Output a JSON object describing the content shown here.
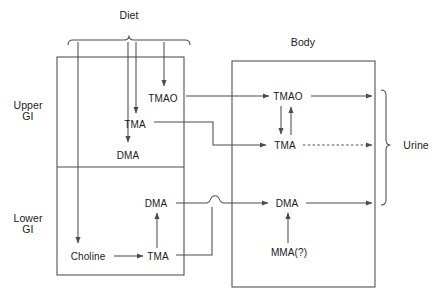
{
  "diagram": {
    "type": "flow-diagram",
    "canvas": {
      "width": 441,
      "height": 300,
      "background": "#ffffff"
    },
    "stroke_color": "#4d4d4d",
    "text_color": "#1a1a1a",
    "groups": [
      {
        "id": "diet",
        "name": "diet-brace-group",
        "label": "Diet",
        "label_x": 129,
        "label_y": 15,
        "brace": {
          "x1": 68,
          "x2": 190,
          "y": 40,
          "tip_x": 129,
          "orientation": "down"
        },
        "feeds": [
          "Choline",
          "DMA",
          "TMA",
          "TMAO"
        ]
      },
      {
        "id": "gi",
        "name": "gi-tract-box",
        "label": "",
        "box": {
          "x": 57,
          "y": 57,
          "w": 127,
          "h": 218
        },
        "divider_y": 167,
        "compartments": [
          {
            "id": "upper-gi",
            "label": "Upper\nGI",
            "label_x": 28,
            "label_y": 111
          },
          {
            "id": "lower-gi",
            "label": "Lower\nGI",
            "label_x": 28,
            "label_y": 224
          }
        ]
      },
      {
        "id": "body",
        "name": "body-box",
        "label": "Body",
        "label_x": 303,
        "label_y": 42,
        "box": {
          "x": 232,
          "y": 61,
          "w": 143,
          "h": 226
        }
      },
      {
        "id": "urine",
        "name": "urine-brace-group",
        "label": "Urine",
        "label_x": 416,
        "label_y": 145,
        "brace": {
          "y1": 90,
          "y2": 205,
          "x": 386,
          "tip_y": 145,
          "orientation": "right"
        }
      }
    ],
    "nodes": [
      {
        "id": "gi-tmao",
        "name": "node-gi-tmao",
        "label": "TMAO",
        "x": 163,
        "y": 98,
        "compartment": "upper-gi"
      },
      {
        "id": "gi-tma-u",
        "name": "node-gi-tma-upper",
        "label": "TMA",
        "x": 135,
        "y": 124,
        "compartment": "upper-gi"
      },
      {
        "id": "gi-dma-u",
        "name": "node-gi-dma-upper",
        "label": "DMA",
        "x": 128,
        "y": 155,
        "compartment": "upper-gi"
      },
      {
        "id": "gi-dma-l",
        "name": "node-gi-dma-lower",
        "label": "DMA",
        "x": 156,
        "y": 203,
        "compartment": "lower-gi"
      },
      {
        "id": "gi-choline",
        "name": "node-choline",
        "label": "Choline",
        "x": 88,
        "y": 256,
        "compartment": "lower-gi"
      },
      {
        "id": "gi-tma-l",
        "name": "node-gi-tma-lower",
        "label": "TMA",
        "x": 158,
        "y": 256,
        "compartment": "lower-gi"
      },
      {
        "id": "body-tmao",
        "name": "node-body-tmao",
        "label": "TMAO",
        "x": 288,
        "y": 96,
        "compartment": "body"
      },
      {
        "id": "body-tma",
        "name": "node-body-tma",
        "label": "TMA",
        "x": 285,
        "y": 145,
        "compartment": "body"
      },
      {
        "id": "body-dma",
        "name": "node-body-dma",
        "label": "DMA",
        "x": 287,
        "y": 203,
        "compartment": "body"
      },
      {
        "id": "body-mma",
        "name": "node-mma",
        "label": "MMA(?)",
        "x": 289,
        "y": 252,
        "compartment": "body"
      }
    ],
    "edges": [
      {
        "id": "diet-choline",
        "from": "diet",
        "to": "gi-choline",
        "style": "solid",
        "arrow": true
      },
      {
        "id": "diet-dma",
        "from": "diet",
        "to": "gi-dma-u",
        "style": "solid",
        "arrow": true
      },
      {
        "id": "diet-tma",
        "from": "diet",
        "to": "gi-tma-u",
        "style": "solid",
        "arrow": true
      },
      {
        "id": "diet-tmao",
        "from": "diet",
        "to": "gi-tmao",
        "style": "solid",
        "arrow": true
      },
      {
        "id": "gitmao-bodytmao",
        "from": "gi-tmao",
        "to": "body-tmao",
        "style": "solid",
        "arrow": true
      },
      {
        "id": "gitma-bodytma",
        "from": "gi-tma-u",
        "to": "body-tma",
        "style": "solid",
        "arrow": true
      },
      {
        "id": "gidma-bodydma",
        "from": "gi-dma-l",
        "to": "body-dma",
        "style": "solid",
        "arrow": true,
        "crossing_hop": true
      },
      {
        "id": "gitmal-bodydma",
        "from": "gi-tma-l",
        "to": "body-dma",
        "style": "solid",
        "arrow": true
      },
      {
        "id": "choline-tma",
        "from": "gi-choline",
        "to": "gi-tma-l",
        "style": "solid",
        "arrow": true
      },
      {
        "id": "tma-dma-lower",
        "from": "gi-tma-l",
        "to": "gi-dma-l",
        "style": "solid",
        "arrow": true
      },
      {
        "id": "tmao-to-tma",
        "from": "body-tmao",
        "to": "body-tma",
        "style": "solid",
        "arrow": true
      },
      {
        "id": "tma-to-tmao",
        "from": "body-tma",
        "to": "body-tmao",
        "style": "solid",
        "arrow": true
      },
      {
        "id": "mma-to-dma",
        "from": "body-mma",
        "to": "body-dma",
        "style": "solid",
        "arrow": true
      },
      {
        "id": "tmao-urine",
        "from": "body-tmao",
        "to": "urine",
        "style": "solid",
        "arrow": true
      },
      {
        "id": "tma-urine",
        "from": "body-tma",
        "to": "urine",
        "style": "dashed",
        "arrow": true
      },
      {
        "id": "dma-urine",
        "from": "body-dma",
        "to": "urine",
        "style": "solid",
        "arrow": true
      }
    ]
  }
}
